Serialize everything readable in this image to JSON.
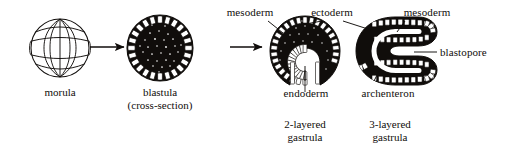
{
  "figure": {
    "background_color": "#ffffff",
    "ink_color": "#100d0b",
    "width": 508,
    "height": 160
  },
  "stages": [
    {
      "id": "morula",
      "caption_line1": "morula",
      "caption_line2": "",
      "center_x": 60,
      "center_y": 48
    },
    {
      "id": "blastula",
      "caption_line1": "blastula",
      "caption_line2": "(cross-section)",
      "center_x": 160,
      "center_y": 48
    },
    {
      "id": "two-layered-gastrula",
      "caption_line1": "2-layered",
      "caption_line2": "gastrula",
      "center_x": 305,
      "center_y": 52
    },
    {
      "id": "three-layered-gastrula",
      "caption_line1": "3-layered",
      "caption_line2": "gastrula",
      "center_x": 390,
      "center_y": 52
    }
  ],
  "arrows": [
    {
      "id": "arrow-morula-to-blastula",
      "from_x": 90,
      "to_x": 126,
      "y": 47
    },
    {
      "id": "arrow-blastula-to-gastrula",
      "from_x": 228,
      "to_x": 264,
      "y": 47
    }
  ],
  "labels": [
    {
      "id": "mesoderm-left",
      "text": "mesoderm",
      "x": 250,
      "y": 8
    },
    {
      "id": "ectoderm",
      "text": "ectoderm",
      "x": 332,
      "y": 8
    },
    {
      "id": "mesoderm-right",
      "text": "mesoderm",
      "x": 427,
      "y": 8
    },
    {
      "id": "blastopore",
      "text": "blastopore",
      "x": 466,
      "y": 47
    },
    {
      "id": "endoderm",
      "text": "endoderm",
      "x": 306,
      "y": 88
    },
    {
      "id": "archenteron",
      "text": "archenteron",
      "x": 388,
      "y": 88
    }
  ],
  "captions": [
    {
      "id": "caption-morula",
      "line1": "morula",
      "line2": "",
      "x": 60,
      "y": 88
    },
    {
      "id": "caption-blastula",
      "line1": "blastula",
      "line2": "(cross-section)",
      "x": 160,
      "y": 88
    },
    {
      "id": "caption-two-layered",
      "line1": "2-layered",
      "line2": "gastrula",
      "x": 305,
      "y": 120
    },
    {
      "id": "caption-three-layered",
      "line1": "3-layered",
      "line2": "gastrula",
      "x": 390,
      "y": 120
    }
  ]
}
